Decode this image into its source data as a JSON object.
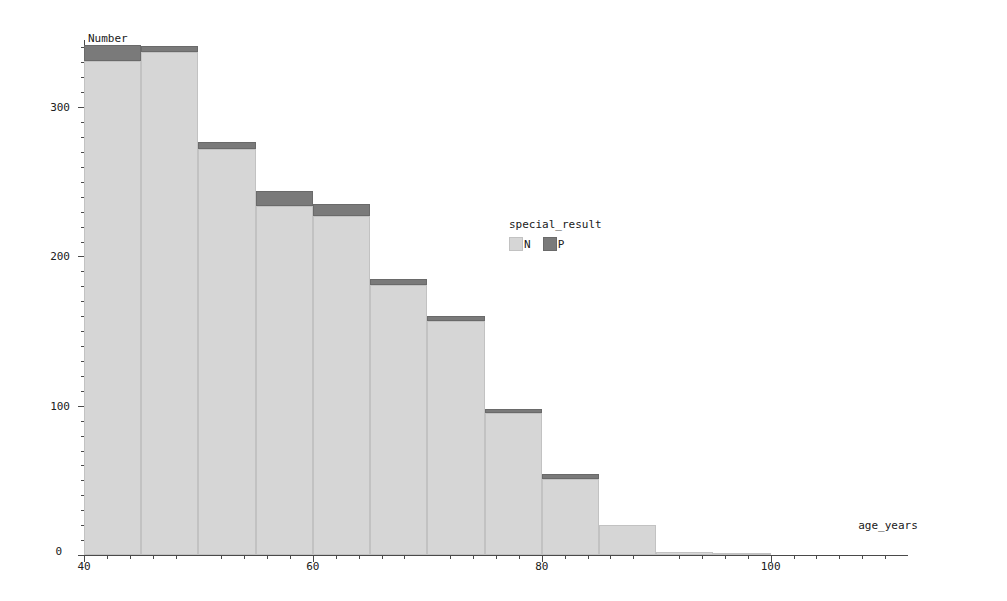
{
  "chart_data": {
    "type": "bar",
    "title": "",
    "subtitle": "",
    "xlabel": "age_years",
    "ylabel": "Number",
    "xlim": [
      40,
      112
    ],
    "ylim": [
      0,
      345
    ],
    "grid": false,
    "stacked": true,
    "bin_width": 5,
    "legend": {
      "title": "special_result",
      "position": "inside-center-right",
      "entries": [
        {
          "name": "N",
          "color": "#d6d6d6"
        },
        {
          "name": "P",
          "color": "#7a7a7a"
        }
      ]
    },
    "x_ticks_major": [
      40,
      60,
      80,
      100
    ],
    "x_tick_labels": [
      "40",
      "60",
      "80",
      "100"
    ],
    "x_ticks_minor": [
      42,
      44,
      46,
      48,
      52,
      54,
      56,
      58,
      62,
      64,
      66,
      68,
      72,
      74,
      76,
      78,
      82,
      84,
      86,
      88,
      92,
      94,
      96,
      98,
      102,
      104,
      106,
      108,
      110
    ],
    "y_ticks_major": [
      0,
      100,
      200,
      300
    ],
    "y_tick_labels": [
      "0",
      "100",
      "200",
      "300"
    ],
    "y_ticks_minor": [
      10,
      20,
      30,
      40,
      50,
      60,
      70,
      80,
      90,
      110,
      120,
      130,
      140,
      150,
      160,
      170,
      180,
      190,
      210,
      220,
      230,
      240,
      250,
      260,
      270,
      280,
      290,
      310,
      320,
      330,
      340
    ],
    "bins": [
      {
        "x0": 40,
        "x1": 45
      },
      {
        "x0": 45,
        "x1": 50
      },
      {
        "x0": 50,
        "x1": 55
      },
      {
        "x0": 55,
        "x1": 60
      },
      {
        "x0": 60,
        "x1": 65
      },
      {
        "x0": 65,
        "x1": 70
      },
      {
        "x0": 70,
        "x1": 75
      },
      {
        "x0": 75,
        "x1": 80
      },
      {
        "x0": 80,
        "x1": 85
      },
      {
        "x0": 85,
        "x1": 90
      },
      {
        "x0": 90,
        "x1": 95
      },
      {
        "x0": 95,
        "x1": 100
      },
      {
        "x0": 100,
        "x1": 105
      },
      {
        "x0": 105,
        "x1": 110
      }
    ],
    "categories": [
      "40-45",
      "45-50",
      "50-55",
      "55-60",
      "60-65",
      "65-70",
      "70-75",
      "75-80",
      "80-85",
      "85-90",
      "90-95",
      "95-100",
      "100-105",
      "105-110"
    ],
    "series": [
      {
        "name": "N",
        "color": "#d6d6d6",
        "values": [
          331,
          337,
          272,
          234,
          227,
          181,
          157,
          95,
          51,
          20,
          2,
          1,
          0,
          0
        ]
      },
      {
        "name": "P",
        "color": "#7a7a7a",
        "values": [
          11,
          4,
          5,
          10,
          8,
          4,
          3,
          3,
          3,
          0,
          0,
          0,
          0,
          0
        ]
      }
    ],
    "totals": [
      342,
      341,
      277,
      244,
      235,
      185,
      160,
      98,
      54,
      20,
      2,
      1,
      0,
      0
    ]
  }
}
